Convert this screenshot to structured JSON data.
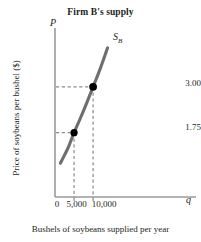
{
  "chart_data": {
    "type": "line",
    "title": "Firm B's supply",
    "xlabel": "Bushels of soybeans supplied per year",
    "ylabel": "Price of soybeans per bushel ($)",
    "x_axis_variable": "q",
    "y_axis_variable": "P",
    "xlim": [
      0,
      37000
    ],
    "ylim": [
      0,
      4.6
    ],
    "grid": false,
    "legend": "none",
    "x_tick_labels": [
      "0",
      "5,000",
      "10,000"
    ],
    "x_tick_values": [
      0,
      5000,
      10000
    ],
    "y_tick_labels": [
      "1.75",
      "3.00"
    ],
    "y_tick_values": [
      1.75,
      3.0
    ],
    "series": [
      {
        "name": "S_B",
        "label_text": "S",
        "label_subscript": "B",
        "color": "#6e6e6e",
        "x": [
          1400,
          2400,
          3600,
          5000,
          6600,
          8200,
          10000,
          11900,
          13800
        ],
        "y": [
          0.92,
          1.12,
          1.38,
          1.75,
          2.13,
          2.53,
          3.0,
          3.5,
          4.06
        ]
      }
    ],
    "annotated_points": [
      {
        "name": "point-low",
        "x": 5000,
        "y": 1.75,
        "x_label": "5,000",
        "y_label": "1.75",
        "color": "#000000"
      },
      {
        "name": "point-high",
        "x": 10000,
        "y": 3.0,
        "x_label": "10,000",
        "y_label": "3.00",
        "color": "#000000"
      }
    ],
    "dashed_guides": true,
    "dashed_color": "#8c8c8c",
    "axis_color": "#9a9a9a"
  },
  "figure": {
    "title": "Firm B's supply",
    "x_axis_title": "Bushels of soybeans supplied per year",
    "y_axis_title": "Price of soybeans per bushel ($)",
    "x_axis_variable": "q",
    "y_axis_variable": "P",
    "curve_label": "S",
    "curve_label_sub": "B",
    "ytick_1": "3.00",
    "ytick_2": "1.75",
    "xtick_0": "0",
    "xtick_1": "5,000",
    "xtick_2": "10,000"
  }
}
